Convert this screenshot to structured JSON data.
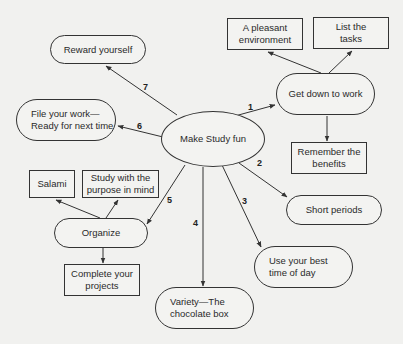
{
  "diagram": {
    "title": "Make Study fun",
    "center": {
      "id": "center",
      "label": "Make Study fun",
      "shape": "ellipse",
      "x": 161,
      "y": 111,
      "w": 104,
      "h": 56
    },
    "nodes": [
      {
        "id": "get-down-to-work",
        "label": "Get down to work",
        "shape": "pill",
        "align": "center",
        "x": 276,
        "y": 73,
        "w": 99,
        "h": 42
      },
      {
        "id": "pleasant-environment",
        "label": "A pleasant\nenvironment",
        "shape": "rect",
        "x": 227,
        "y": 18,
        "w": 76,
        "h": 32
      },
      {
        "id": "list-tasks",
        "label": "List the\ntasks",
        "shape": "rect",
        "x": 313,
        "y": 17,
        "w": 76,
        "h": 32
      },
      {
        "id": "remember-benefits",
        "label": "Remember the\nbenefits",
        "shape": "rect",
        "x": 291,
        "y": 142,
        "w": 76,
        "h": 32
      },
      {
        "id": "short-periods",
        "label": "Short periods",
        "shape": "pill",
        "align": "center",
        "x": 286,
        "y": 195,
        "w": 96,
        "h": 30
      },
      {
        "id": "best-time-of-day",
        "label": "Use your best\ntime of day",
        "shape": "pill",
        "align": "left",
        "x": 254,
        "y": 246,
        "w": 99,
        "h": 42
      },
      {
        "id": "variety-chocolate-box",
        "label": "Variety—The\nchocolate box",
        "shape": "pill",
        "align": "left",
        "x": 155,
        "y": 287,
        "w": 99,
        "h": 42
      },
      {
        "id": "organize",
        "label": "Organize",
        "shape": "pill",
        "align": "center",
        "x": 54,
        "y": 218,
        "w": 94,
        "h": 30
      },
      {
        "id": "salami",
        "label": "Salami",
        "shape": "rect",
        "x": 29,
        "y": 170,
        "w": 46,
        "h": 28
      },
      {
        "id": "study-with-purpose",
        "label": "Study with the\npurpose in mind",
        "shape": "rect",
        "x": 82,
        "y": 170,
        "w": 77,
        "h": 28
      },
      {
        "id": "complete-projects",
        "label": "Complete your\nprojects",
        "shape": "rect",
        "x": 64,
        "y": 264,
        "w": 76,
        "h": 32
      },
      {
        "id": "file-your-work",
        "label": "File your work—\nReady for next time",
        "shape": "pill",
        "align": "left",
        "x": 16,
        "y": 99,
        "w": 100,
        "h": 42
      },
      {
        "id": "reward-yourself",
        "label": "Reward yourself",
        "shape": "pill",
        "align": "center",
        "x": 50,
        "y": 35,
        "w": 96,
        "h": 29
      }
    ],
    "edges": [
      {
        "from": [
          202,
          125
        ],
        "to": [
          275,
          105
        ],
        "label": "1",
        "lx": 248,
        "ly": 102
      },
      {
        "from": [
          321,
          73
        ],
        "to": [
          268,
          52
        ],
        "label": "",
        "lx": 0,
        "ly": 0
      },
      {
        "from": [
          329,
          73
        ],
        "to": [
          352,
          51
        ],
        "label": "",
        "lx": 0,
        "ly": 0
      },
      {
        "from": [
          327,
          116
        ],
        "to": [
          327,
          141
        ],
        "label": "",
        "lx": 0,
        "ly": 0
      },
      {
        "from": [
          239,
          163
        ],
        "to": [
          287,
          197
        ],
        "label": "2",
        "lx": 257,
        "ly": 158
      },
      {
        "from": [
          222,
          165
        ],
        "to": [
          261,
          247
        ],
        "label": "3",
        "lx": 242,
        "ly": 196
      },
      {
        "from": [
          203,
          167
        ],
        "to": [
          203,
          286
        ],
        "label": "4",
        "lx": 193,
        "ly": 218
      },
      {
        "from": [
          185,
          165
        ],
        "to": [
          147,
          224
        ],
        "label": "5",
        "lx": 167,
        "ly": 195
      },
      {
        "from": [
          106,
          218
        ],
        "to": [
          118,
          200
        ],
        "label": "",
        "lx": 0,
        "ly": 0
      },
      {
        "from": [
          100,
          218
        ],
        "to": [
          56,
          200
        ],
        "label": "",
        "lx": 0,
        "ly": 0
      },
      {
        "from": [
          103,
          248
        ],
        "to": [
          103,
          263
        ],
        "label": "",
        "lx": 0,
        "ly": 0
      },
      {
        "from": [
          163,
          137
        ],
        "to": [
          118,
          126
        ],
        "label": "6",
        "lx": 137,
        "ly": 121
      },
      {
        "from": [
          177,
          115
        ],
        "to": [
          106,
          66
        ],
        "label": "7",
        "lx": 143,
        "ly": 82
      }
    ]
  }
}
